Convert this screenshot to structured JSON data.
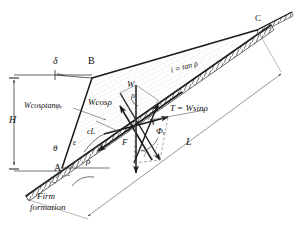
{
  "figure": {
    "kind": "slope-stability-force-diagram"
  },
  "points": {
    "a": "A",
    "b": "B",
    "c": "C"
  },
  "dimensions": {
    "height": "H",
    "length": "L"
  },
  "angles": {
    "delta": "δ",
    "theta": "θ",
    "epsilon": "ε",
    "rho_base": "ρ",
    "rho_force": "ρ",
    "phi_r": "Φ",
    "phi_r_sub": "r"
  },
  "forces": {
    "weight": "W",
    "normal": "N",
    "friction_resultant": "F",
    "tangential": "T = Wsinρ",
    "normal_component": "Wcosρ",
    "friction_component_main": "Wcosρtanφ",
    "friction_component_sub": "r",
    "cohesion": "cL"
  },
  "annotations": {
    "slope_ratio": "i = tan ρ",
    "firm_formation_line1": "Firm",
    "firm_formation_line2": "formation"
  },
  "colors": {
    "ink": "#1a1a1a",
    "thin": "#555555",
    "fill": "#ffffff",
    "stipple": "#8f8f8f"
  }
}
